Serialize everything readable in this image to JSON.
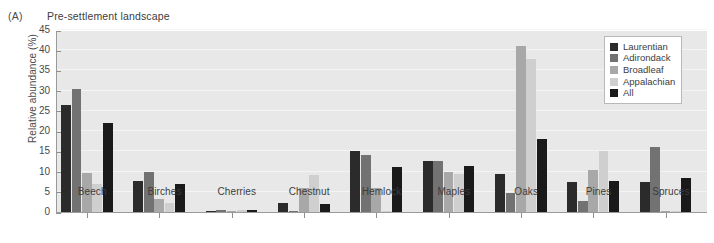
{
  "panel": {
    "tag": "(A)",
    "title": "Pre-settlement landscape"
  },
  "chart_data": {
    "type": "bar",
    "title": "Pre-settlement landscape",
    "xlabel": "",
    "ylabel": "Relative abundance (%)",
    "ylim": [
      0,
      45
    ],
    "ytick_values": [
      "0",
      "5",
      "10",
      "15",
      "20",
      "25",
      "30",
      "35",
      "40",
      "45"
    ],
    "grid": true,
    "legend_position": "top-right",
    "categories": [
      "Beech",
      "Birches",
      "Cherries",
      "Chestnut",
      "Hemlock",
      "Maples",
      "Oaks",
      "Pines",
      "Spruces"
    ],
    "series": [
      {
        "name": "Laurentian",
        "color": "#2b2b2b",
        "values": [
          26.5,
          7.7,
          0.3,
          2.2,
          15.0,
          12.5,
          9.3,
          7.3,
          7.3
        ]
      },
      {
        "name": "Adirondack",
        "color": "#727272",
        "values": [
          30.3,
          10.0,
          0.4,
          0.3,
          14.0,
          12.5,
          4.7,
          2.8,
          16.0
        ]
      },
      {
        "name": "Broadleaf",
        "color": "#a8a8a8",
        "values": [
          9.7,
          3.3,
          0.3,
          6.0,
          6.0,
          10.0,
          41.0,
          10.3,
          0.2
        ]
      },
      {
        "name": "Appalachian",
        "color": "#cfcfcf",
        "values": [
          7.0,
          2.3,
          0.4,
          9.2,
          0.3,
          9.5,
          37.8,
          15.0,
          0.3
        ]
      },
      {
        "name": "All",
        "color": "#1a1a1a",
        "values": [
          22.0,
          7.0,
          0.4,
          2.0,
          11.2,
          11.5,
          18.0,
          7.7,
          8.5
        ]
      }
    ]
  }
}
